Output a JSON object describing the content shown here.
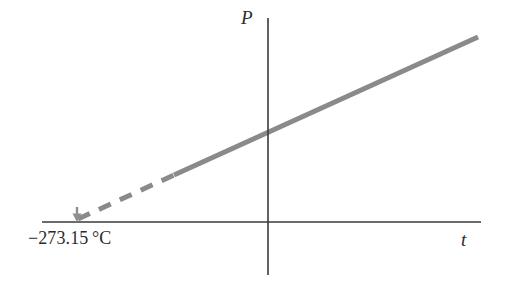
{
  "figure": {
    "kind": "line-diagram",
    "width": 509,
    "height": 293,
    "background": "#ffffff"
  },
  "axes": {
    "vertical": {
      "label": "P",
      "name": "pressure-axis",
      "color": "#3a3a3a",
      "x": 268,
      "y_top": 18,
      "y_bottom": 275
    },
    "horizontal": {
      "label": "t",
      "name": "temperature-axis",
      "color": "#3a3a3a",
      "y": 222,
      "x_left": 42,
      "x_right": 481
    }
  },
  "annotations": {
    "absolute_zero_label": "−273.15 °C",
    "absolute_zero_marker": {
      "name": "absolute-zero-arrow",
      "color": "#8a8a8a",
      "x": 77,
      "y_top": 207,
      "y_bottom": 222
    }
  },
  "chart_data": {
    "type": "line",
    "title": "",
    "xlabel": "t",
    "ylabel": "P",
    "grid": false,
    "legend": "none",
    "series": [
      {
        "name": "measured-pressure",
        "style": "solid",
        "color": "#8a8a8a",
        "width": 5,
        "points": [
          {
            "x": 174,
            "y": 175
          },
          {
            "x": 478,
            "y": 37
          }
        ]
      },
      {
        "name": "extrapolation-to-absolute-zero",
        "style": "dashed",
        "color": "#8a8a8a",
        "width": 5,
        "dash": "13 10",
        "points": [
          {
            "x": 78,
            "y": 219
          },
          {
            "x": 174,
            "y": 175
          }
        ]
      }
    ],
    "annotations": [
      {
        "text": "−273.15 °C",
        "x": 78,
        "y": 222,
        "role": "absolute-zero"
      },
      {
        "text": "P",
        "x": 268,
        "y": 18,
        "role": "y-axis-name"
      },
      {
        "text": "t",
        "x": 481,
        "y": 222,
        "role": "x-axis-name"
      }
    ]
  }
}
